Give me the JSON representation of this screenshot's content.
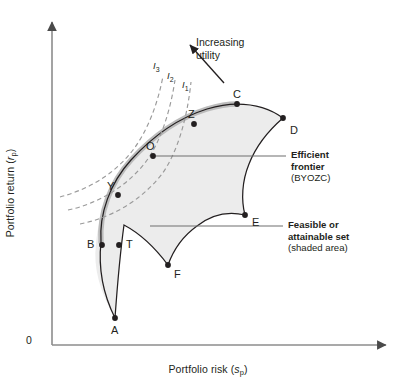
{
  "figure": {
    "type": "efficient-frontier-diagram",
    "axes": {
      "y_label_text": "Portfolio return (",
      "y_label_var": "r",
      "y_label_sub": "p",
      "y_label_close": ")",
      "x_label_text": "Portfolio risk (",
      "x_label_var": "s",
      "x_label_sub": "p",
      "x_label_close": ")",
      "origin": "0"
    },
    "utility_arrow": {
      "line1": "Increasing",
      "line2": "utility"
    },
    "indifference_curves": [
      {
        "id": "I3",
        "var": "I",
        "sub": "3"
      },
      {
        "id": "I2",
        "var": "I",
        "sub": "2"
      },
      {
        "id": "I1",
        "var": "I",
        "sub": "1"
      }
    ],
    "points": [
      {
        "label": "A"
      },
      {
        "label": "B"
      },
      {
        "label": "T"
      },
      {
        "label": "C"
      },
      {
        "label": "D"
      },
      {
        "label": "E"
      },
      {
        "label": "F"
      },
      {
        "label": "O"
      },
      {
        "label": "Y"
      },
      {
        "label": "Z"
      }
    ],
    "callouts": [
      {
        "id": "efficient-frontier",
        "bold_line1": "Efficient",
        "bold_line2": "frontier",
        "regular_line": "(BYOZC)"
      },
      {
        "id": "feasible-set",
        "bold_line1": "Feasible or",
        "bold_line2": "attainable set",
        "regular_line": "(shaded area)"
      }
    ],
    "colors": {
      "frontier_highlight": "#bcbcbc",
      "boundary": "#231f20",
      "shaded_fill": "#ececec",
      "indifference": "#9a9a9a",
      "axis": "#8c8c8c",
      "text": "#231f20"
    }
  }
}
